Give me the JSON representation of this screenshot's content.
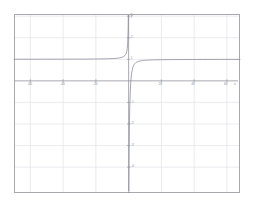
{
  "chart_data": {
    "type": "line",
    "title": "",
    "subtitle": "",
    "xlabel": "x",
    "ylabel": "y",
    "xlim": [
      -70,
      68
    ],
    "ylim": [
      -5.2,
      3.1
    ],
    "grid": true,
    "legend": null,
    "annotations": [],
    "asymptotes": {
      "vertical": 0,
      "horizontal": 1
    },
    "xticks": [
      -60,
      -40,
      -20,
      20,
      40,
      60
    ],
    "xtick_labels": [
      "-60",
      "-40",
      "-20",
      "20",
      "40",
      "60"
    ],
    "yticks": [
      -4,
      -3,
      -2,
      -1,
      1,
      2,
      3
    ],
    "ytick_labels": [
      "-4",
      "-3",
      "-2",
      "-1",
      "1",
      "2",
      "3"
    ],
    "series": [
      {
        "name": "curve",
        "color": "#8a8a99",
        "left_branch": [
          {
            "x": -70,
            "y": 1.002
          },
          {
            "x": -60,
            "y": 1.003
          },
          {
            "x": -50,
            "y": 1.004
          },
          {
            "x": -40,
            "y": 1.005
          },
          {
            "x": -32,
            "y": 1.007
          },
          {
            "x": -26,
            "y": 1.009
          },
          {
            "x": -21,
            "y": 1.012
          },
          {
            "x": -17,
            "y": 1.016
          },
          {
            "x": -13,
            "y": 1.023
          },
          {
            "x": -10,
            "y": 1.032
          },
          {
            "x": -7.5,
            "y": 1.045
          },
          {
            "x": -5.5,
            "y": 1.065
          },
          {
            "x": -4,
            "y": 1.095
          },
          {
            "x": -3,
            "y": 1.13
          },
          {
            "x": -2.2,
            "y": 1.18
          },
          {
            "x": -1.6,
            "y": 1.25
          },
          {
            "x": -1.15,
            "y": 1.36
          },
          {
            "x": -0.85,
            "y": 1.5
          },
          {
            "x": -0.62,
            "y": 1.72
          },
          {
            "x": -0.45,
            "y": 2.0
          },
          {
            "x": -0.33,
            "y": 2.35
          },
          {
            "x": -0.25,
            "y": 2.7
          },
          {
            "x": -0.2,
            "y": 3.0
          }
        ],
        "right_branch": [
          {
            "x": 0.14,
            "y": -5.2
          },
          {
            "x": 0.2,
            "y": -4.3
          },
          {
            "x": 0.28,
            "y": -3.4
          },
          {
            "x": 0.38,
            "y": -2.6
          },
          {
            "x": 0.52,
            "y": -1.85
          },
          {
            "x": 0.7,
            "y": -1.2
          },
          {
            "x": 0.95,
            "y": -0.6
          },
          {
            "x": 1.3,
            "y": -0.05
          },
          {
            "x": 1.8,
            "y": 0.35
          },
          {
            "x": 2.5,
            "y": 0.62
          },
          {
            "x": 3.4,
            "y": 0.77
          },
          {
            "x": 4.6,
            "y": 0.86
          },
          {
            "x": 6.2,
            "y": 0.91
          },
          {
            "x": 8.5,
            "y": 0.945
          },
          {
            "x": 11.5,
            "y": 0.962
          },
          {
            "x": 15,
            "y": 0.973
          },
          {
            "x": 20,
            "y": 0.981
          },
          {
            "x": 27,
            "y": 0.986
          },
          {
            "x": 35,
            "y": 0.99
          },
          {
            "x": 45,
            "y": 0.992
          },
          {
            "x": 56,
            "y": 0.994
          },
          {
            "x": 68,
            "y": 0.995
          }
        ]
      }
    ],
    "colors": {
      "background": "#ffffff",
      "frame": "#a9a9ad",
      "grid": "#e2e2ea",
      "axis": "#9b9ba4",
      "curve": "#8a8a99",
      "tick_text": "#8e8e96"
    }
  }
}
